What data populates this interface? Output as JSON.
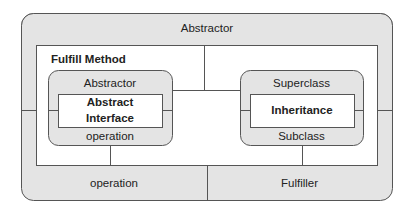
{
  "diagram": {
    "outer": {
      "label": "Abstractor"
    },
    "fulfill_method": {
      "label": "Fulfill Method"
    },
    "left_box": {
      "top_label": "Abstractor",
      "inner_line1": "Abstract",
      "inner_line2": "Interface",
      "bottom_label": "operation"
    },
    "right_box": {
      "top_label": "Superclass",
      "inner_label": "Inheritance",
      "bottom_label": "Subclass"
    },
    "bottom_left": {
      "label": "operation"
    },
    "bottom_right": {
      "label": "Fulfiller"
    }
  },
  "colors": {
    "fill": "#e4e4e4",
    "stroke": "#555555",
    "white": "#ffffff"
  }
}
